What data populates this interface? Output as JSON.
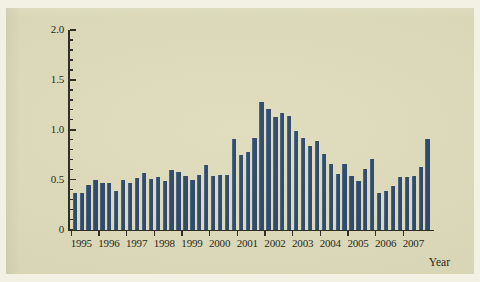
{
  "figure": {
    "background_color": "#dedcba",
    "bar_color": "#2c4668",
    "axis_color": "#2b2a22",
    "axis_title_x": "Year"
  },
  "chart_data": {
    "type": "bar",
    "title": "",
    "xlabel": "Year",
    "ylabel": "",
    "ylim": [
      0,
      2.0
    ],
    "ytick_labels": [
      "0",
      "0.5",
      "1.0",
      "1.5",
      "2.0"
    ],
    "ytick_values": [
      0,
      0.5,
      1.0,
      1.5,
      2.0
    ],
    "yminor_step": 0.1,
    "grid": false,
    "legend": false,
    "xtick_labels": [
      "1995",
      "1996",
      "1997",
      "1998",
      "1999",
      "2000",
      "2001",
      "2002",
      "2003",
      "2004",
      "2005",
      "2006",
      "2007"
    ],
    "categories": [
      "1995 Q1",
      "1995 Q2",
      "1995 Q3",
      "1995 Q4",
      "1996 Q1",
      "1996 Q2",
      "1996 Q3",
      "1996 Q4",
      "1997 Q1",
      "1997 Q2",
      "1997 Q3",
      "1997 Q4",
      "1998 Q1",
      "1998 Q2",
      "1998 Q3",
      "1998 Q4",
      "1999 Q1",
      "1999 Q2",
      "1999 Q3",
      "1999 Q4",
      "2000 Q1",
      "2000 Q2",
      "2000 Q3",
      "2000 Q4",
      "2001 Q1",
      "2001 Q2",
      "2001 Q3",
      "2001 Q4",
      "2002 Q1",
      "2002 Q2",
      "2002 Q3",
      "2002 Q4",
      "2003 Q1",
      "2003 Q2",
      "2003 Q3",
      "2003 Q4",
      "2004 Q1",
      "2004 Q2",
      "2004 Q3",
      "2004 Q4",
      "2005 Q1",
      "2005 Q2",
      "2005 Q3",
      "2005 Q4",
      "2006 Q1",
      "2006 Q2",
      "2006 Q3",
      "2006 Q4",
      "2007 Q1",
      "2007 Q2",
      "2007 Q3",
      "2007 Q4"
    ],
    "values": [
      0.37,
      0.37,
      0.45,
      0.5,
      0.47,
      0.47,
      0.39,
      0.5,
      0.47,
      0.52,
      0.57,
      0.51,
      0.53,
      0.49,
      0.6,
      0.58,
      0.54,
      0.5,
      0.55,
      0.65,
      0.54,
      0.55,
      0.55,
      0.91,
      0.75,
      0.78,
      0.92,
      1.28,
      1.21,
      1.13,
      1.17,
      1.14,
      0.99,
      0.92,
      0.84,
      0.89,
      0.76,
      0.66,
      0.56,
      0.66,
      0.54,
      0.49,
      0.61,
      0.71,
      0.37,
      0.39,
      0.44,
      0.53,
      0.53,
      0.54,
      0.63,
      0.91
    ]
  }
}
